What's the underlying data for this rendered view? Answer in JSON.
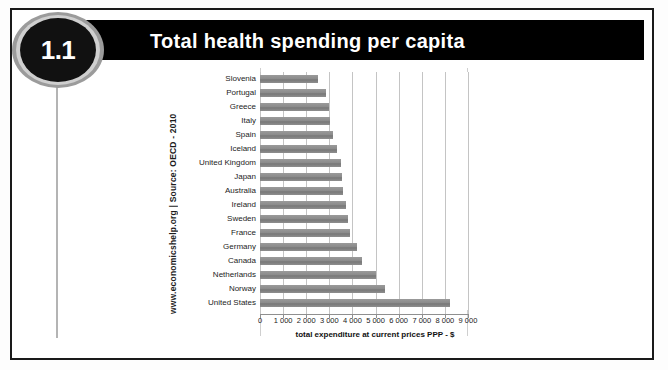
{
  "badge": {
    "number": "1.1"
  },
  "header": {
    "title": "Total health spending per capita"
  },
  "source_note": "www.economicshelp.org | Source: OECD - 2010",
  "chart_data": {
    "type": "bar",
    "orientation": "horizontal",
    "title": "Total health spending per capita",
    "xlabel": "total expenditure at current prices PPP - $",
    "ylabel": "",
    "xlim": [
      0,
      9000
    ],
    "grid": true,
    "legend": false,
    "source": "www.economicshelp.org | Source: OECD - 2010",
    "tick_labels": [
      "0",
      "1 000",
      "2 000",
      "3 000",
      "4 000",
      "5 000",
      "6 000",
      "7 000",
      "8 000",
      "9 000"
    ],
    "tick_values": [
      0,
      1000,
      2000,
      3000,
      4000,
      5000,
      6000,
      7000,
      8000,
      9000
    ],
    "categories": [
      "Slovenia",
      "Portugal",
      "Greece",
      "Italy",
      "Spain",
      "Iceland",
      "United Kingdom",
      "Japan",
      "Australia",
      "Ireland",
      "Sweden",
      "France",
      "Germany",
      "Canada",
      "Netherlands",
      "Norway",
      "United States"
    ],
    "values": [
      2500,
      2850,
      3000,
      3050,
      3150,
      3350,
      3500,
      3550,
      3600,
      3700,
      3800,
      3900,
      4200,
      4400,
      5000,
      5400,
      8200
    ],
    "bar_color": "#8c8c8c"
  }
}
